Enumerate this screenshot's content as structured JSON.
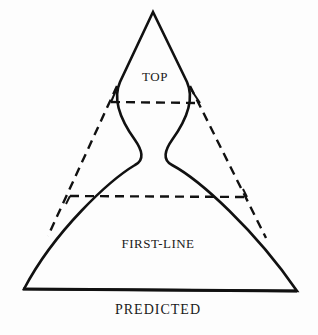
{
  "diagram": {
    "labels": {
      "top": "TOP",
      "first_line": "FIRST-LINE",
      "predicted": "PREDICTED"
    },
    "colors": {
      "stroke": "#111111",
      "background": "#fdfdfd"
    }
  }
}
